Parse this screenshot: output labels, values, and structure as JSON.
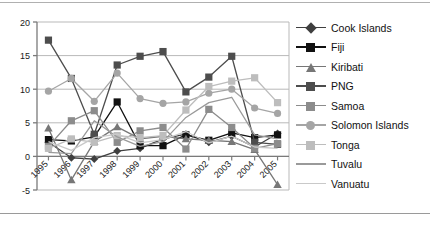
{
  "chart_data": {
    "type": "line",
    "title": "",
    "xlabel": "",
    "ylabel": "",
    "x": [
      "1995",
      "1996",
      "1997",
      "1998",
      "1999",
      "2000",
      "2001",
      "2002",
      "2003",
      "2004",
      "2005"
    ],
    "ylim": [
      -5,
      20
    ],
    "yticks": [
      -5,
      0,
      5,
      10,
      15,
      20
    ],
    "ytick_labels": [
      "-5",
      "0",
      "5",
      "10",
      "15",
      "20"
    ],
    "grid": true,
    "grid_axis": "y",
    "legend_position": "right",
    "series": [
      {
        "name": "Cook Islands",
        "marker": "diamond",
        "color": "#3f3f3f",
        "values": [
          2.1,
          -0.2,
          -0.4,
          0.8,
          1.2,
          2.6,
          3.3,
          2.1,
          3.0,
          1.4,
          3.4
        ]
      },
      {
        "name": "Fiji",
        "marker": "square",
        "color": "#111111",
        "values": [
          2.5,
          2.3,
          2.9,
          8.1,
          1.6,
          1.6,
          3.2,
          2.4,
          3.5,
          2.8,
          3.2
        ]
      },
      {
        "name": "Kiribati",
        "marker": "triangle",
        "color": "#777777",
        "values": [
          4.2,
          -3.5,
          2.2,
          4.4,
          2.6,
          3.0,
          2.6,
          2.4,
          2.2,
          1.0,
          -4.2
        ]
      },
      {
        "name": "PNG",
        "marker": "square",
        "color": "#4d4d4d",
        "values": [
          17.3,
          11.6,
          3.3,
          13.6,
          14.9,
          15.6,
          9.6,
          11.8,
          14.9,
          2.1,
          1.8
        ]
      },
      {
        "name": "Samoa",
        "marker": "square",
        "color": "#8c8c8c",
        "values": [
          1.5,
          5.3,
          6.8,
          2.1,
          3.8,
          4.3,
          1.1,
          7.0,
          4.3,
          1.2,
          1.9
        ]
      },
      {
        "name": "Solomon Islands",
        "marker": "circle",
        "color": "#a5a5a5",
        "values": [
          9.7,
          11.6,
          8.2,
          12.4,
          8.6,
          7.9,
          8.1,
          9.4,
          10.0,
          7.2,
          6.4
        ]
      },
      {
        "name": "Tonga",
        "marker": "square",
        "color": "#bdbdbd",
        "values": [
          1.2,
          2.6,
          2.1,
          3.1,
          2.8,
          3.1,
          6.9,
          10.4,
          11.2,
          11.7,
          8.0
        ]
      },
      {
        "name": "Tuvalu",
        "marker": "none",
        "color": "#9a9a9a",
        "values": [
          0.6,
          0.4,
          5.3,
          2.9,
          1.5,
          2.2,
          5.8,
          8.0,
          8.8,
          3.2,
          2.6
        ]
      },
      {
        "name": "Vanuatu",
        "marker": "none",
        "color": "#c9c9c9",
        "values": [
          2.2,
          0.9,
          2.8,
          3.3,
          2.0,
          2.5,
          3.7,
          2.0,
          3.0,
          1.4,
          1.2
        ]
      }
    ]
  },
  "axis": {
    "y_tick_labels": [
      "20",
      "15",
      "10",
      "5",
      "0",
      "-5"
    ],
    "x_tick_labels": [
      "1995",
      "1996",
      "1997",
      "1998",
      "1999",
      "2000",
      "2001",
      "2002",
      "2003",
      "2004",
      "2005"
    ]
  },
  "legend": {
    "items": [
      {
        "label": "Cook Islands",
        "marker": "diamond-marker",
        "color": "#3f3f3f"
      },
      {
        "label": "Fiji",
        "marker": "square-marker",
        "color": "#111111"
      },
      {
        "label": "Kiribati",
        "marker": "triangle-marker",
        "color": "#777777"
      },
      {
        "label": "PNG",
        "marker": "square-marker",
        "color": "#4d4d4d"
      },
      {
        "label": "Samoa",
        "marker": "square-marker",
        "color": "#8c8c8c"
      },
      {
        "label": "Solomon Islands",
        "marker": "circle-marker",
        "color": "#a5a5a5"
      },
      {
        "label": "Tonga",
        "marker": "square-marker",
        "color": "#bdbdbd"
      },
      {
        "label": "Tuvalu",
        "marker": "none",
        "color": "#9a9a9a"
      },
      {
        "label": "Vanuatu",
        "marker": "none",
        "color": "#c9c9c9"
      }
    ]
  },
  "style": {
    "plot_border_color": "#8f8f8f",
    "grid_color": "#b9b9b9",
    "axis_color": "#7a7a7a",
    "background": "#ffffff"
  }
}
